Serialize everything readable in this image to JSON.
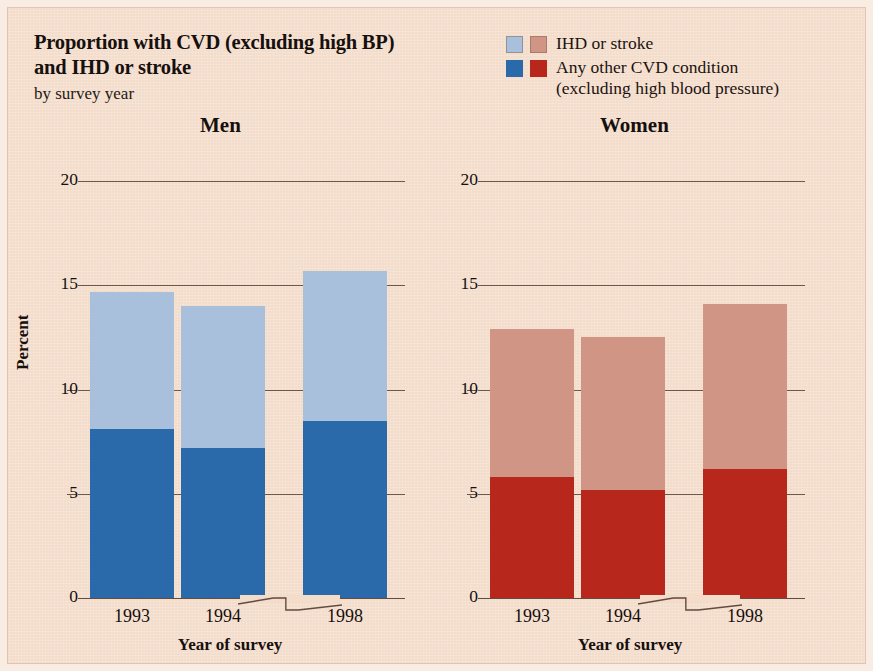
{
  "header": {
    "title_line1": "Proportion with CVD (excluding high BP)",
    "title_line2": "and IHD or stroke",
    "subtitle": "by survey year"
  },
  "legend": {
    "items": [
      {
        "label": "IHD or stroke",
        "label_sub": "",
        "swatch_men": "#a9c0dd",
        "swatch_women": "#d09584"
      },
      {
        "label": "Any other CVD condition",
        "label_sub": "(excluding high blood pressure)",
        "swatch_men": "#2a6aab",
        "swatch_women": "#b7271c"
      }
    ]
  },
  "colors": {
    "background": "#f4dcca",
    "men_light": "#a9c0dd",
    "men_dark": "#2a6aab",
    "women_light": "#d09584",
    "women_dark": "#b7271c",
    "axis": "#4a3026"
  },
  "chart_data": {
    "type": "bar",
    "title": "Proportion with CVD (excluding high BP) and IHD or stroke",
    "subtitle": "by survey year",
    "xlabel": "Year of survey",
    "ylabel": "Percent",
    "ylim": [
      0,
      20
    ],
    "yticks": [
      "0",
      "5",
      "10",
      "15",
      "20"
    ],
    "ytick_values": [
      0,
      5,
      10,
      15,
      20
    ],
    "grid": true,
    "legend_position": "top-right",
    "stacked": true,
    "axis_break_between": [
      "1994",
      "1998"
    ],
    "categories": [
      "1993",
      "1994",
      "1998"
    ],
    "panels": [
      {
        "name": "Men",
        "series": [
          {
            "name": "Any other CVD condition (excluding high blood pressure)",
            "values": [
              8.1,
              7.2,
              8.5
            ],
            "color": "#2a6aab"
          },
          {
            "name": "IHD or stroke",
            "values": [
              6.6,
              6.8,
              7.2
            ],
            "color": "#a9c0dd"
          }
        ],
        "totals": [
          14.7,
          14.0,
          15.7
        ]
      },
      {
        "name": "Women",
        "series": [
          {
            "name": "Any other CVD condition (excluding high blood pressure)",
            "values": [
              5.8,
              5.2,
              6.2
            ],
            "color": "#b7271c"
          },
          {
            "name": "IHD or stroke",
            "values": [
              7.1,
              7.3,
              7.9
            ],
            "color": "#d09584"
          }
        ],
        "totals": [
          12.9,
          12.5,
          14.1
        ]
      }
    ]
  },
  "panels_ui": {
    "men": {
      "title": "Men",
      "xlabel": "Year of survey",
      "ylabel": "Percent",
      "xticks": [
        "1993",
        "1994",
        "1998"
      ],
      "yticks": [
        "0",
        "5",
        "10",
        "15",
        "20"
      ]
    },
    "women": {
      "title": "Women",
      "xlabel": "Year of survey",
      "ylabel": "",
      "xticks": [
        "1993",
        "1994",
        "1998"
      ],
      "yticks": [
        "0",
        "5",
        "10",
        "15",
        "20"
      ]
    }
  }
}
